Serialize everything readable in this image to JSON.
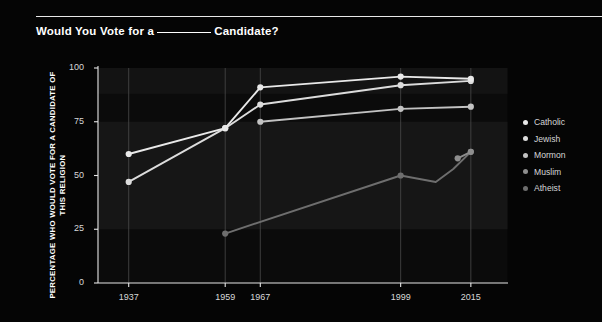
{
  "header": {
    "title_prefix": "Would You Vote for a",
    "title_suffix": "Candidate?",
    "blank": "________"
  },
  "legend": {
    "position": "right",
    "items": [
      {
        "label": "Catholic",
        "color": "#e9e9e9"
      },
      {
        "label": "Jewish",
        "color": "#dcdcdc"
      },
      {
        "label": "Mormon",
        "color": "#c2c2c2"
      },
      {
        "label": "Muslim",
        "color": "#8e8e8e"
      },
      {
        "label": "Atheist",
        "color": "#6e6e6e"
      }
    ]
  },
  "chart_data": {
    "type": "line",
    "xlabel": "",
    "ylabel": "PERCENTAGE WHO WOULD VOTE FOR A CANDIDATE OF THIS RELIGION",
    "xlim": [
      1930,
      2018
    ],
    "ylim": [
      0,
      100
    ],
    "yticks": [
      0,
      25,
      50,
      75,
      100
    ],
    "xticks": [
      1937,
      1959,
      1967,
      1999,
      2015
    ],
    "grid": "vertical",
    "series": [
      {
        "name": "Catholic",
        "color": "#e9e9e9",
        "x": [
          1937,
          1959,
          1967,
          1999,
          2015
        ],
        "values": [
          60,
          72,
          91,
          96,
          95
        ]
      },
      {
        "name": "Jewish",
        "color": "#dcdcdc",
        "x": [
          1937,
          1959,
          1967,
          1999,
          2015
        ],
        "values": [
          47,
          72,
          83,
          92,
          94
        ]
      },
      {
        "name": "Mormon",
        "color": "#c2c2c2",
        "x": [
          1967,
          1999,
          2015
        ],
        "values": [
          75,
          81,
          82
        ]
      },
      {
        "name": "Muslim",
        "color": "#8e8e8e",
        "x": [
          2012,
          2015
        ],
        "values": [
          58,
          61
        ]
      },
      {
        "name": "Atheist",
        "color": "#6e6e6e",
        "x": [
          1959,
          1999,
          2007,
          2011,
          2015
        ],
        "values": [
          23,
          50,
          47,
          53,
          61
        ]
      }
    ]
  }
}
